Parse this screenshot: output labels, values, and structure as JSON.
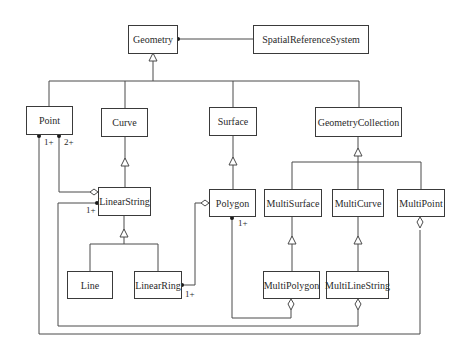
{
  "diagram": {
    "type": "uml-class-diagram",
    "classes": {
      "geometry": "Geometry",
      "srs": "SpatialReferenceSystem",
      "point": "Point",
      "curve": "Curve",
      "surface": "Surface",
      "geometry_collection": "GeometryCollection",
      "linear_string": "LinearString",
      "polygon": "Polygon",
      "multi_surface": "MultiSurface",
      "multi_curve": "MultiCurve",
      "multi_point": "MultiPoint",
      "line": "Line",
      "linear_ring": "LinearRing",
      "multi_polygon": "MultiPolygon",
      "multi_line_string": "MultiLineString"
    },
    "multiplicities": {
      "point_to_linearstring_1": "1+",
      "point_to_linearstring_2": "2+",
      "linearstring_to_multilinestring": "1+",
      "polygon_to_multipolygon": "1+",
      "linearring_to_polygon": "1+"
    },
    "relationships": [
      {
        "from": "Geometry",
        "to": "SpatialReferenceSystem",
        "kind": "association"
      },
      {
        "from": "Point",
        "to": "Geometry",
        "kind": "generalization"
      },
      {
        "from": "Curve",
        "to": "Geometry",
        "kind": "generalization"
      },
      {
        "from": "Surface",
        "to": "Geometry",
        "kind": "generalization"
      },
      {
        "from": "GeometryCollection",
        "to": "Geometry",
        "kind": "generalization"
      },
      {
        "from": "LinearString",
        "to": "Curve",
        "kind": "generalization"
      },
      {
        "from": "Polygon",
        "to": "Surface",
        "kind": "generalization"
      },
      {
        "from": "MultiSurface",
        "to": "GeometryCollection",
        "kind": "generalization"
      },
      {
        "from": "MultiCurve",
        "to": "GeometryCollection",
        "kind": "generalization"
      },
      {
        "from": "MultiPoint",
        "to": "GeometryCollection",
        "kind": "generalization"
      },
      {
        "from": "Line",
        "to": "LinearString",
        "kind": "generalization"
      },
      {
        "from": "LinearRing",
        "to": "LinearString",
        "kind": "generalization"
      },
      {
        "from": "MultiPolygon",
        "to": "MultiSurface",
        "kind": "generalization"
      },
      {
        "from": "MultiLineString",
        "to": "MultiCurve",
        "kind": "generalization"
      },
      {
        "from": "Point",
        "to": "LinearString",
        "kind": "aggregation",
        "multiplicity": "2+"
      },
      {
        "from": "LinearRing",
        "to": "Polygon",
        "kind": "aggregation",
        "multiplicity": "1+"
      },
      {
        "from": "Polygon",
        "to": "MultiPolygon",
        "kind": "aggregation",
        "multiplicity": "1+"
      },
      {
        "from": "LinearString",
        "to": "MultiLineString",
        "kind": "aggregation",
        "multiplicity": "1+"
      },
      {
        "from": "Point",
        "to": "MultiPoint",
        "kind": "aggregation",
        "multiplicity": "1+"
      }
    ]
  }
}
